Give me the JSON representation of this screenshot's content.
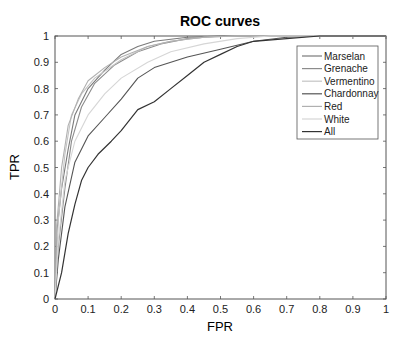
{
  "chart_data": {
    "type": "line",
    "title": "ROC curves",
    "xlabel": "FPR",
    "ylabel": "TPR",
    "xlim": [
      0,
      1
    ],
    "ylim": [
      0,
      1
    ],
    "xticks": [
      "0",
      "0.1",
      "0.2",
      "0.3",
      "0.4",
      "0.5",
      "0.6",
      "0.7",
      "0.8",
      "0.9",
      "1"
    ],
    "yticks": [
      "0",
      "0.1",
      "0.2",
      "0.3",
      "0.4",
      "0.5",
      "0.6",
      "0.7",
      "0.8",
      "0.9",
      "1"
    ],
    "grid": false,
    "legend_position": "upper right",
    "series": [
      {
        "name": "Marselan",
        "color": "#7a7a7a",
        "width": 1.1,
        "points": [
          [
            0,
            0
          ],
          [
            0.005,
            0.25
          ],
          [
            0.02,
            0.42
          ],
          [
            0.04,
            0.57
          ],
          [
            0.06,
            0.7
          ],
          [
            0.1,
            0.8
          ],
          [
            0.15,
            0.87
          ],
          [
            0.2,
            0.93
          ],
          [
            0.25,
            0.96
          ],
          [
            0.3,
            0.98
          ],
          [
            0.4,
            0.995
          ],
          [
            0.5,
            1
          ],
          [
            1,
            1
          ]
        ]
      },
      {
        "name": "Grenache",
        "color": "#8c8c8c",
        "width": 1.1,
        "points": [
          [
            0,
            0
          ],
          [
            0.01,
            0.2
          ],
          [
            0.03,
            0.42
          ],
          [
            0.05,
            0.6
          ],
          [
            0.08,
            0.73
          ],
          [
            0.12,
            0.82
          ],
          [
            0.18,
            0.89
          ],
          [
            0.25,
            0.94
          ],
          [
            0.32,
            0.97
          ],
          [
            0.4,
            0.99
          ],
          [
            0.5,
            1
          ],
          [
            1,
            1
          ]
        ]
      },
      {
        "name": "Vermentino",
        "color": "#c4c4c4",
        "width": 1.1,
        "points": [
          [
            0,
            0
          ],
          [
            0.01,
            0.3
          ],
          [
            0.03,
            0.55
          ],
          [
            0.05,
            0.7
          ],
          [
            0.08,
            0.78
          ],
          [
            0.12,
            0.84
          ],
          [
            0.2,
            0.91
          ],
          [
            0.28,
            0.96
          ],
          [
            0.35,
            0.98
          ],
          [
            0.45,
            0.995
          ],
          [
            0.55,
            1
          ],
          [
            1,
            1
          ]
        ]
      },
      {
        "name": "Chardonnay",
        "color": "#555555",
        "width": 1.1,
        "points": [
          [
            0,
            0
          ],
          [
            0.01,
            0.15
          ],
          [
            0.03,
            0.35
          ],
          [
            0.06,
            0.52
          ],
          [
            0.1,
            0.62
          ],
          [
            0.15,
            0.69
          ],
          [
            0.2,
            0.76
          ],
          [
            0.25,
            0.84
          ],
          [
            0.3,
            0.88
          ],
          [
            0.4,
            0.92
          ],
          [
            0.5,
            0.95
          ],
          [
            0.6,
            0.98
          ],
          [
            0.7,
            0.995
          ],
          [
            0.8,
            1
          ],
          [
            1,
            1
          ]
        ]
      },
      {
        "name": "Red",
        "color": "#b0b0b0",
        "width": 1.1,
        "points": [
          [
            0,
            0
          ],
          [
            0.005,
            0.28
          ],
          [
            0.02,
            0.5
          ],
          [
            0.04,
            0.66
          ],
          [
            0.07,
            0.76
          ],
          [
            0.1,
            0.83
          ],
          [
            0.15,
            0.88
          ],
          [
            0.2,
            0.92
          ],
          [
            0.28,
            0.96
          ],
          [
            0.35,
            0.98
          ],
          [
            0.45,
            0.995
          ],
          [
            0.55,
            1
          ],
          [
            1,
            1
          ]
        ]
      },
      {
        "name": "White",
        "color": "#d6d6d6",
        "width": 1.1,
        "points": [
          [
            0,
            0
          ],
          [
            0.01,
            0.22
          ],
          [
            0.03,
            0.45
          ],
          [
            0.06,
            0.6
          ],
          [
            0.1,
            0.7
          ],
          [
            0.15,
            0.78
          ],
          [
            0.2,
            0.84
          ],
          [
            0.28,
            0.9
          ],
          [
            0.35,
            0.94
          ],
          [
            0.45,
            0.97
          ],
          [
            0.55,
            0.99
          ],
          [
            0.65,
            1
          ],
          [
            1,
            1
          ]
        ]
      },
      {
        "name": "All",
        "color": "#333333",
        "width": 1.2,
        "points": [
          [
            0,
            0
          ],
          [
            0.02,
            0.1
          ],
          [
            0.04,
            0.25
          ],
          [
            0.06,
            0.36
          ],
          [
            0.08,
            0.45
          ],
          [
            0.1,
            0.5
          ],
          [
            0.13,
            0.55
          ],
          [
            0.17,
            0.6
          ],
          [
            0.2,
            0.64
          ],
          [
            0.25,
            0.72
          ],
          [
            0.3,
            0.75
          ],
          [
            0.35,
            0.8
          ],
          [
            0.4,
            0.85
          ],
          [
            0.45,
            0.9
          ],
          [
            0.5,
            0.93
          ],
          [
            0.55,
            0.96
          ],
          [
            0.6,
            0.98
          ],
          [
            0.7,
            0.99
          ],
          [
            0.8,
            1
          ],
          [
            1,
            1
          ]
        ]
      }
    ]
  }
}
